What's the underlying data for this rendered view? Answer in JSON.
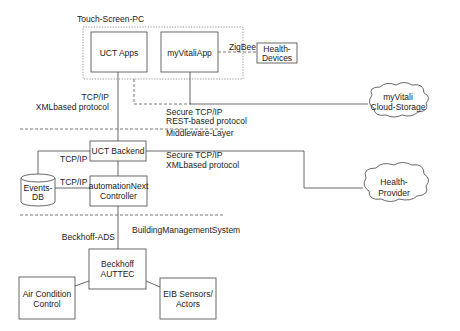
{
  "groups": {
    "touch_screen_pc": "Touch-Screen-PC"
  },
  "layers": {
    "middleware": "Middleware-Layer",
    "building": "BuildingManagementSystem"
  },
  "nodes": {
    "uct_apps": "UCT Apps",
    "myvitali_app": "myVitaliApp",
    "health_devices": [
      "Health-",
      "Devices"
    ],
    "myvitali_cloud": [
      "myVitali",
      "Cloud-Storage"
    ],
    "uct_backend": "UCT Backend",
    "automation_next": [
      "automationNext",
      "Controller"
    ],
    "events_db": [
      "Events-",
      "DB"
    ],
    "health_provider": [
      "Health-",
      "Provider"
    ],
    "beckhoff": [
      "Beckhoff",
      "AUTTEC"
    ],
    "air_condition": [
      "Air Condition",
      "Control"
    ],
    "eib_sensors": [
      "EIB Sensors/",
      "Actors"
    ]
  },
  "edges": {
    "zigbee": "ZigBee",
    "apps_backend": [
      "TCP/IP",
      "XMLbased protocol"
    ],
    "app_cloud": [
      "Secure TCP/IP",
      "REST-based protocol"
    ],
    "backend_db": "TCP/IP",
    "controller_db": "TCP/IP",
    "backend_provider": [
      "Secure TCP/IP",
      "XMLbased protocol"
    ],
    "beckhoff_ads": "Beckhoff-ADS"
  }
}
